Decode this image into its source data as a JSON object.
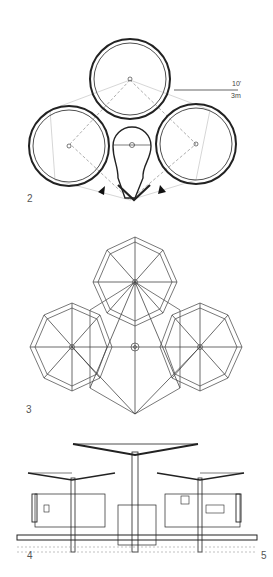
{
  "figures": [
    {
      "number": "2",
      "kind": "floor-plan"
    },
    {
      "number": "3",
      "kind": "roof-framing-plan"
    },
    {
      "number": "4",
      "kind": "section-elevation"
    }
  ],
  "extra_label": "5",
  "scale": {
    "imperial": "10'",
    "metric": "3m"
  },
  "colors": {
    "line": "#222222",
    "light_line": "#999999",
    "background": "#ffffff"
  }
}
